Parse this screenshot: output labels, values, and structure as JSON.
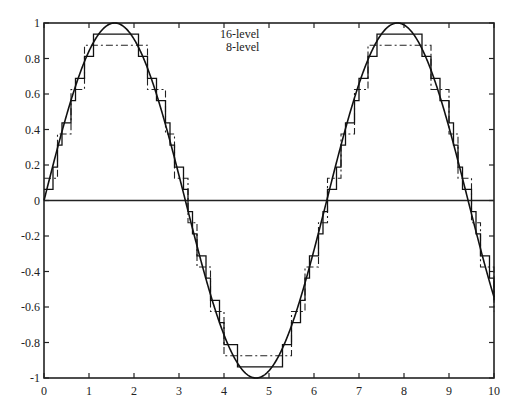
{
  "chart_data": {
    "type": "line",
    "title": "",
    "xlabel": "",
    "ylabel": "",
    "xlim": [
      0,
      10
    ],
    "ylim": [
      -1,
      1
    ],
    "grid": false,
    "x_ticks": [
      0,
      1,
      2,
      3,
      4,
      5,
      6,
      7,
      8,
      9,
      10
    ],
    "x_tick_labels": [
      "0",
      "1",
      "2",
      "3",
      "4",
      "5",
      "6",
      "7",
      "8",
      "9",
      "10"
    ],
    "y_ticks": [
      -1,
      -0.8,
      -0.6,
      -0.4,
      -0.2,
      0,
      0.2,
      0.4,
      0.6,
      0.8,
      1
    ],
    "y_tick_labels": [
      "-1",
      "-0.8",
      "-0.6",
      "-0.4",
      "-0.2",
      "0",
      "0.2",
      "0.4",
      "0.6",
      "0.8",
      "1"
    ],
    "zero_line": true,
    "legend": {
      "position": "top-center",
      "entries": [
        {
          "label": "16-level",
          "style": "solid"
        },
        {
          "label": "8-level",
          "style": "dash-dot"
        }
      ]
    },
    "series": [
      {
        "name": "sin(x)",
        "style": "solid-smooth",
        "function": "sin",
        "x_range": [
          0,
          10
        ]
      },
      {
        "name": "16-level",
        "style": "solid-step",
        "levels": 16,
        "sample_step": 0.1,
        "quantized_values_are": "odd multiples of 1/16",
        "max_level": 0.9375,
        "min_level": -0.9375
      },
      {
        "name": "8-level",
        "style": "dash-dot-step",
        "levels": 8,
        "sample_step": 0.1,
        "quantized_values_are": "odd multiples of 1/8",
        "max_level": 0.875,
        "min_level": -0.875
      }
    ]
  },
  "colors": {
    "axis": "#222222",
    "curve": "#111111",
    "step16": "#111111",
    "step8": "#222222",
    "step8_tint": "#2e7d4f"
  }
}
